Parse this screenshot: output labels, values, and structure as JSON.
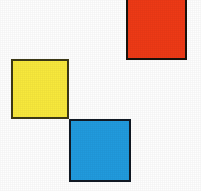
{
  "figure": {
    "title": "Three colored squares arranged diagonally",
    "background_color": "#fefefe",
    "width": 201,
    "height": 191,
    "outline_color": "#141210",
    "outline_width": 2
  },
  "shapes": [
    {
      "id": "sq-red",
      "name": "red-square",
      "label": "Red square",
      "color_name": "red",
      "fill": "#ee3a16",
      "stroke": "#1a120c",
      "stroke_width": 2,
      "x": 126,
      "y": -3,
      "width": 61,
      "height": 63,
      "position": "top-right"
    },
    {
      "id": "sq-yellow",
      "name": "yellow-square",
      "label": "Yellow square",
      "color_name": "yellow",
      "fill": "#f8e93c",
      "stroke": "#3d3a16",
      "stroke_width": 2,
      "x": 11,
      "y": 59,
      "width": 58,
      "height": 60,
      "position": "middle-left"
    },
    {
      "id": "sq-blue",
      "name": "blue-square",
      "label": "Blue square",
      "color_name": "blue",
      "fill": "#219bde",
      "stroke": "#121a24",
      "stroke_width": 2,
      "x": 69,
      "y": 119,
      "width": 62,
      "height": 63,
      "position": "bottom-center"
    }
  ]
}
